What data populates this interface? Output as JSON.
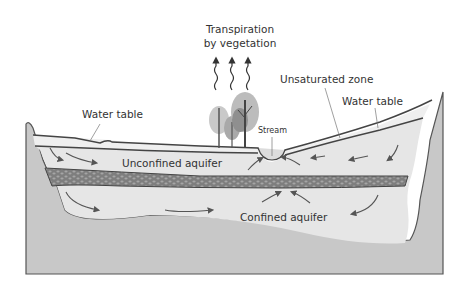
{
  "diagram": {
    "type": "groundwater cross-section",
    "labels": {
      "transpiration_line1": "Transpiration",
      "transpiration_line2": "by vegetation",
      "water_table_left": "Water table",
      "unsaturated_zone": "Unsaturated zone",
      "water_table_right": "Water table",
      "stream": "Stream",
      "unconfined_aquifer": "Unconfined aquifer",
      "confined_aquifer": "Confined aquifer"
    },
    "colors": {
      "background": "#ffffff",
      "bedrock": "#c8c8c8",
      "aquifer": "#e6e6e6",
      "unsaturated": "#efefef",
      "confining_layer": "#8a8a8a",
      "outline": "#444444",
      "trees_light": "#c9c9c9",
      "trees_dark": "#9a9a9a",
      "text": "#333333"
    },
    "transpiration_arrows": 3
  }
}
